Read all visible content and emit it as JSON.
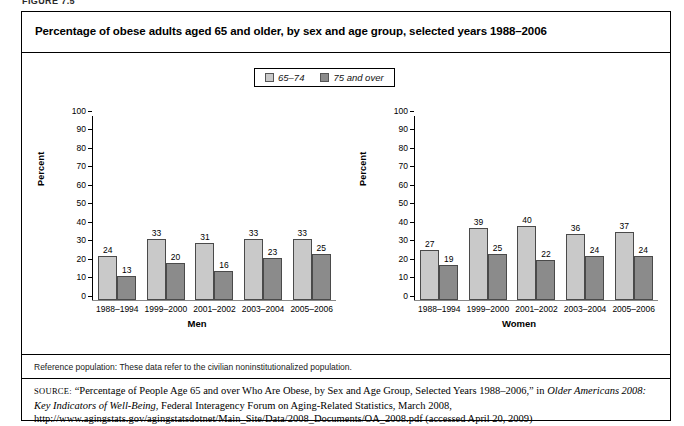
{
  "figure_number": "FIGURE 7.5",
  "title": "Percentage of obese adults aged 65 and older, by sex and age group, selected years 1988–2006",
  "legend": {
    "items": [
      {
        "label": "65–74",
        "color": "#c9c9c9"
      },
      {
        "label": "75 and over",
        "color": "#8b8b8b"
      }
    ]
  },
  "reference_population": "Reference population: These data refer to the civilian noninstitutionalized population.",
  "source": {
    "label": "SOURCE:",
    "text": " “Percentage of People Age 65 and over Who Are Obese, by Sex and Age Group, Selected Years 1988–2006,” in ",
    "italic1": "Older Americans 2008: Key Indicators of Well-Being",
    "text2": ", Federal Interagency Forum on Aging-Related Statistics, March 2008, http://www.agingstats.gov/agingstatsdotnet/Main_Site/Data/2008_Documents/OA_2008.pdf (accessed April 20, 2009)"
  },
  "chart_data": {
    "type": "bar",
    "title": "Percentage of obese adults aged 65 and older, by sex and age group, selected years 1988–2006",
    "xlabel": "",
    "ylabel": "Percent",
    "ylim": [
      0,
      100
    ],
    "yticks": [
      0,
      10,
      20,
      30,
      40,
      50,
      60,
      70,
      80,
      90,
      100
    ],
    "grid": false,
    "legend_position": "top-center",
    "panels": [
      {
        "name": "Men",
        "categories": [
          "1988–1994",
          "1999–2000",
          "2001–2002",
          "2003–2004",
          "2005–2006"
        ],
        "series": [
          {
            "name": "65–74",
            "color": "#c9c9c9",
            "values": [
              24,
              33,
              31,
              33,
              33
            ]
          },
          {
            "name": "75 and over",
            "color": "#8b8b8b",
            "values": [
              13,
              20,
              16,
              23,
              25
            ]
          }
        ]
      },
      {
        "name": "Women",
        "categories": [
          "1988–1994",
          "1999–2000",
          "2001–2002",
          "2003–2004",
          "2005–2006"
        ],
        "series": [
          {
            "name": "65–74",
            "color": "#c9c9c9",
            "values": [
              27,
              39,
              40,
              36,
              37
            ]
          },
          {
            "name": "75 and over",
            "color": "#8b8b8b",
            "values": [
              19,
              25,
              22,
              24,
              24
            ]
          }
        ]
      }
    ]
  }
}
